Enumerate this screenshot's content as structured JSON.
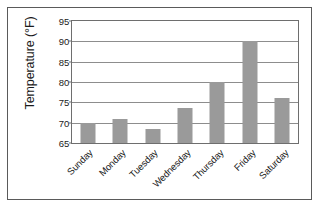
{
  "chart_data": {
    "type": "bar",
    "title": "",
    "xlabel": "",
    "ylabel": "Temperature (°F)",
    "categories": [
      "Sunday",
      "Monday",
      "Tuesday",
      "Wednesday",
      "Thursday",
      "Friday",
      "Saturday"
    ],
    "values": [
      70,
      71,
      68.5,
      73.5,
      80,
      90,
      76
    ],
    "ylim": [
      65,
      95
    ],
    "yticks": [
      65,
      70,
      75,
      80,
      85,
      90,
      95
    ],
    "ytick_labels": [
      "65",
      "70",
      "75",
      "80",
      "85",
      "90",
      "95"
    ],
    "grid": true,
    "legend": false,
    "bar_color": "#9a9a9a",
    "axis_color": "#6e6e6e",
    "gridline_color": "#8d8d8d",
    "frame_color": "#5a5a5a",
    "background_color": "#ffffff"
  }
}
